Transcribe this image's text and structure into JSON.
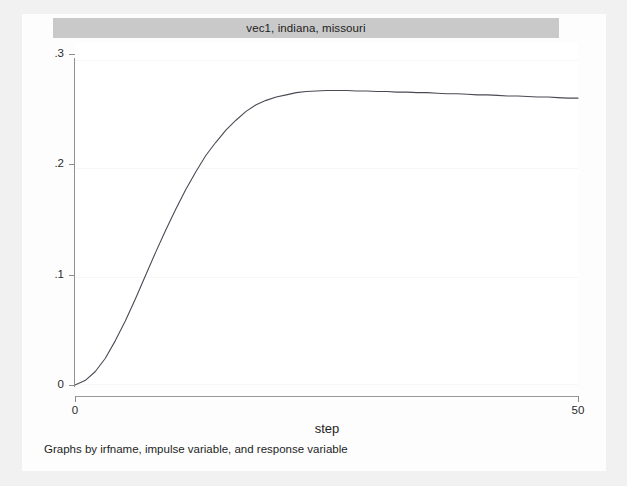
{
  "figure": {
    "panel_title": "vec1, indiana, missouri",
    "note": "Graphs by irfname, impulse variable, and response variable",
    "background_color": "#fdfdfd",
    "title_bar_color": "#c9c9c9",
    "line_color": "#4a4a55"
  },
  "axes": {
    "x_title": "step",
    "y_title": "",
    "x_ticks": [
      {
        "value": 0,
        "label": "0"
      },
      {
        "value": 50,
        "label": "50"
      }
    ],
    "y_ticks": [
      {
        "value": 0.3,
        "label": ".3"
      },
      {
        "value": 0.2,
        "label": ".2"
      },
      {
        "value": 0.1,
        "label": ".1"
      },
      {
        "value": 0,
        "label": "0"
      }
    ]
  },
  "chart_data": {
    "type": "line",
    "title": "vec1, indiana, missouri",
    "subtitle": "",
    "xlabel": "step",
    "ylabel": "",
    "xlim": [
      0,
      50
    ],
    "ylim": [
      0,
      0.31
    ],
    "grid": true,
    "legend": "none",
    "annotations": [
      "Graphs by irfname, impulse variable, and response variable"
    ],
    "series": [
      {
        "name": "irf: vec1, indiana, missouri",
        "x": [
          0,
          1,
          2,
          3,
          4,
          5,
          6,
          7,
          8,
          9,
          10,
          11,
          12,
          13,
          14,
          15,
          16,
          17,
          18,
          19,
          20,
          21,
          22,
          23,
          24,
          25,
          26,
          27,
          28,
          29,
          30,
          31,
          32,
          33,
          34,
          35,
          36,
          37,
          38,
          39,
          40,
          41,
          42,
          43,
          44,
          45,
          46,
          47,
          48,
          49,
          50
        ],
        "values": [
          0.0,
          0.004,
          0.012,
          0.024,
          0.04,
          0.058,
          0.078,
          0.099,
          0.12,
          0.14,
          0.159,
          0.177,
          0.193,
          0.208,
          0.22,
          0.231,
          0.24,
          0.248,
          0.254,
          0.258,
          0.261,
          0.263,
          0.265,
          0.266,
          0.2665,
          0.267,
          0.267,
          0.267,
          0.2665,
          0.2665,
          0.266,
          0.266,
          0.2655,
          0.2655,
          0.265,
          0.265,
          0.2645,
          0.264,
          0.264,
          0.2635,
          0.263,
          0.263,
          0.2625,
          0.262,
          0.262,
          0.2615,
          0.261,
          0.261,
          0.2605,
          0.26,
          0.26
        ]
      }
    ]
  }
}
